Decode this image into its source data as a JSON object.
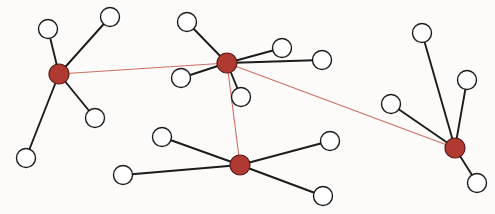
{
  "diagram": {
    "type": "node-link-graph",
    "width": 495,
    "height": 214,
    "background_color": "#fdfbf9",
    "styles": {
      "hub_fill": "#b03a32",
      "hub_stroke": "#5a1a16",
      "hub_radius": 10,
      "leaf_fill": "#ffffff",
      "leaf_stroke": "#1c1c1c",
      "leaf_radius": 9.5,
      "leaf_stroke_width": 1.4,
      "hub_stroke_width": 1.2,
      "edge_leaf_color": "#1c1c1c",
      "edge_leaf_width": 1.9,
      "edge_hub_color": "#cc6f63",
      "edge_hub_width": 1.1
    },
    "legend": {
      "hub_label": "hub node",
      "leaf_label": "leaf node",
      "hub_edge_label": "hub-to-hub link",
      "leaf_edge_label": "hub-to-leaf link"
    },
    "nodes": [
      {
        "id": "h1",
        "label": "",
        "kind": "hub",
        "x": 59,
        "y": 74
      },
      {
        "id": "h2",
        "label": "",
        "kind": "hub",
        "x": 227,
        "y": 63
      },
      {
        "id": "h3",
        "label": "",
        "kind": "hub",
        "x": 240,
        "y": 165
      },
      {
        "id": "h4",
        "label": "",
        "kind": "hub",
        "x": 455,
        "y": 148
      },
      {
        "id": "n1",
        "label": "",
        "kind": "leaf",
        "x": 48,
        "y": 29
      },
      {
        "id": "n2",
        "label": "",
        "kind": "leaf",
        "x": 110,
        "y": 17
      },
      {
        "id": "n3",
        "label": "",
        "kind": "leaf",
        "x": 95,
        "y": 118
      },
      {
        "id": "n4",
        "label": "",
        "kind": "leaf",
        "x": 26,
        "y": 158
      },
      {
        "id": "n5",
        "label": "",
        "kind": "leaf",
        "x": 187,
        "y": 22
      },
      {
        "id": "n6",
        "label": "",
        "kind": "leaf",
        "x": 282,
        "y": 48
      },
      {
        "id": "n7",
        "label": "",
        "kind": "leaf",
        "x": 322,
        "y": 60
      },
      {
        "id": "n8",
        "label": "",
        "kind": "leaf",
        "x": 181,
        "y": 78
      },
      {
        "id": "n9",
        "label": "",
        "kind": "leaf",
        "x": 241,
        "y": 97
      },
      {
        "id": "n10",
        "label": "",
        "kind": "leaf",
        "x": 162,
        "y": 137
      },
      {
        "id": "n11",
        "label": "",
        "kind": "leaf",
        "x": 123,
        "y": 175
      },
      {
        "id": "n12",
        "label": "",
        "kind": "leaf",
        "x": 330,
        "y": 141
      },
      {
        "id": "n13",
        "label": "",
        "kind": "leaf",
        "x": 323,
        "y": 196
      },
      {
        "id": "n14",
        "label": "",
        "kind": "leaf",
        "x": 422,
        "y": 33
      },
      {
        "id": "n15",
        "label": "",
        "kind": "leaf",
        "x": 467,
        "y": 80
      },
      {
        "id": "n16",
        "label": "",
        "kind": "leaf",
        "x": 391,
        "y": 104
      },
      {
        "id": "n17",
        "label": "",
        "kind": "leaf",
        "x": 477,
        "y": 183
      }
    ],
    "edges": [
      {
        "source": "h1",
        "target": "n1",
        "kind": "leaf"
      },
      {
        "source": "h1",
        "target": "n2",
        "kind": "leaf"
      },
      {
        "source": "h1",
        "target": "n3",
        "kind": "leaf"
      },
      {
        "source": "h1",
        "target": "n4",
        "kind": "leaf"
      },
      {
        "source": "h2",
        "target": "n5",
        "kind": "leaf"
      },
      {
        "source": "h2",
        "target": "n6",
        "kind": "leaf"
      },
      {
        "source": "h2",
        "target": "n7",
        "kind": "leaf"
      },
      {
        "source": "h2",
        "target": "n8",
        "kind": "leaf"
      },
      {
        "source": "h2",
        "target": "n9",
        "kind": "leaf"
      },
      {
        "source": "h3",
        "target": "n10",
        "kind": "leaf"
      },
      {
        "source": "h3",
        "target": "n11",
        "kind": "leaf"
      },
      {
        "source": "h3",
        "target": "n12",
        "kind": "leaf"
      },
      {
        "source": "h3",
        "target": "n13",
        "kind": "leaf"
      },
      {
        "source": "h4",
        "target": "n14",
        "kind": "leaf"
      },
      {
        "source": "h4",
        "target": "n15",
        "kind": "leaf"
      },
      {
        "source": "h4",
        "target": "n16",
        "kind": "leaf"
      },
      {
        "source": "h4",
        "target": "n17",
        "kind": "leaf"
      },
      {
        "source": "h1",
        "target": "h2",
        "kind": "hub"
      },
      {
        "source": "h2",
        "target": "h3",
        "kind": "hub"
      },
      {
        "source": "h2",
        "target": "h4",
        "kind": "hub"
      }
    ]
  }
}
